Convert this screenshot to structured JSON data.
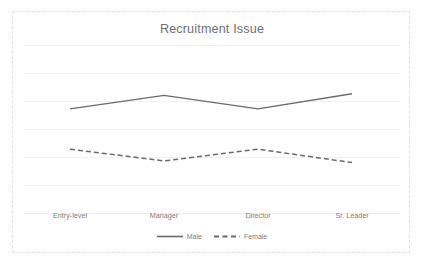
{
  "chart_data": {
    "type": "line",
    "title": "Recruitment Issue",
    "xlabel": "",
    "ylabel": "",
    "categories": [
      "Entry-level",
      "Manager",
      "Director",
      "Sr. Leader"
    ],
    "series": [
      {
        "name": "Male",
        "style": "solid",
        "color": "#6b6b6b",
        "values": [
          62,
          70,
          62,
          71
        ]
      },
      {
        "name": "Female",
        "style": "dashed",
        "color": "#6b6b6b",
        "values": [
          38,
          31,
          38,
          30
        ]
      }
    ],
    "ylim": [
      0,
      100
    ],
    "grid": true,
    "gridline_count": 7,
    "legend_position": "bottom"
  },
  "legend": {
    "items": [
      {
        "label": "Male",
        "style": "solid"
      },
      {
        "label": "Female",
        "style": "dashed"
      }
    ]
  },
  "colors": {
    "line": "#6b6b6b",
    "grid": "#f1f1f1",
    "frame": "#e2e2e2",
    "title_text": "#6f6f6f",
    "label_text": "#7d7d7d",
    "background": "#ffffff"
  }
}
